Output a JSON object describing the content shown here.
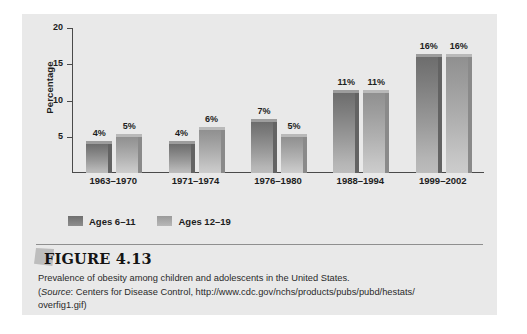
{
  "figure": {
    "title": "FIGURE 4.13",
    "caption_line1": "Prevalence of obesity among children and adolescents in the United States.",
    "source_prefix": "(",
    "source_label": "Source",
    "source_text": ": Centers for Disease Control, http://www.cdc.gov/nchs/products/pubs/pubd/hestats/",
    "source_line2": "overfig1.gif)"
  },
  "chart_data": {
    "type": "bar",
    "title": "",
    "subtitle": "",
    "xlabel": "",
    "ylabel": "Percentage",
    "ylim": [
      0,
      20
    ],
    "yticks": [
      5,
      10,
      15,
      20
    ],
    "ytick_labels": [
      "5",
      "10",
      "15",
      "20"
    ],
    "grid": false,
    "legend_position": "bottom-left",
    "categories": [
      "1963–1970",
      "1971–1974",
      "1976–1980",
      "1988–1994",
      "1999–2002"
    ],
    "series": [
      {
        "name": "Ages 6–11",
        "color": "#7d7d7d",
        "values": [
          4,
          4,
          7,
          11,
          16
        ],
        "labels": [
          "4%",
          "4%",
          "7%",
          "11%",
          "16%"
        ]
      },
      {
        "name": "Ages 12–19",
        "color": "#a8a8a8",
        "values": [
          5,
          6,
          5,
          11,
          16
        ],
        "labels": [
          "5%",
          "6%",
          "5%",
          "11%",
          "16%"
        ]
      }
    ]
  },
  "legend": {
    "items": [
      {
        "label": "Ages 6–11"
      },
      {
        "label": "Ages 12–19"
      }
    ]
  },
  "colors": {
    "panel_background": "#e9e9e9",
    "page_background": "#ffffff",
    "axis": "#4a4a4a",
    "series_dark": "#7d7d7d",
    "series_light": "#a8a8a8",
    "text": "#1d1d1d"
  }
}
